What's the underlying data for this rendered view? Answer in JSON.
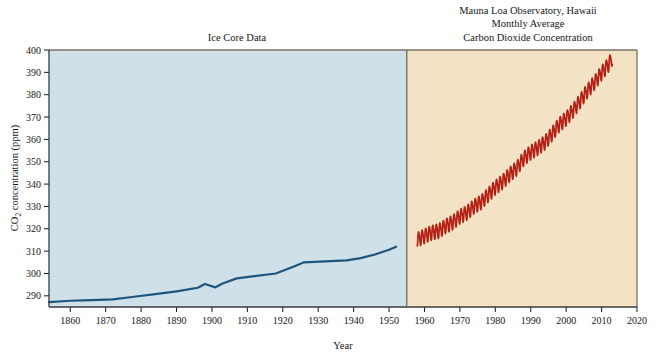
{
  "figure": {
    "titles": {
      "left_panel": "Ice Core Data",
      "right_panel_line1": "Mauna Loa Observatory, Hawaii",
      "right_panel_line2": "Monthly Average",
      "right_panel_line3": "Carbon Dioxide Concentration"
    },
    "colors": {
      "left_panel_background": "#cfe0e9",
      "right_panel_background": "#f4e2c4",
      "ice_core_line": "#1f557c",
      "mauna_loa_line": "#b52015",
      "frame": "#7b7266",
      "text": "#161616",
      "page_background": "#ffffff"
    }
  },
  "chart_data": {
    "type": "line",
    "xlabel": "Year",
    "ylabel": "CO2 concentration (ppm)",
    "ylabel_display": "CO",
    "ylabel_sub": "2",
    "ylabel_rest": " concentration (ppm)",
    "xlim": [
      1854,
      2020
    ],
    "ylim": [
      285,
      400
    ],
    "grid": false,
    "legend": "none",
    "panel_split_year": 1955,
    "xticks": [
      1860,
      1870,
      1880,
      1890,
      1900,
      1910,
      1920,
      1930,
      1940,
      1950,
      1960,
      1970,
      1980,
      1990,
      2000,
      2010,
      2020
    ],
    "yticks": [
      290,
      300,
      310,
      320,
      330,
      340,
      350,
      360,
      370,
      380,
      390,
      400
    ],
    "series": [
      {
        "name": "Ice Core Data",
        "color": "#1f557c",
        "panel": "left",
        "x": [
          1854,
          1860,
          1866,
          1872,
          1878,
          1884,
          1890,
          1896,
          1898,
          1901,
          1903,
          1907,
          1912,
          1918,
          1923,
          1926,
          1932,
          1938,
          1942,
          1946,
          1950,
          1952
        ],
        "values": [
          287.2,
          287.8,
          288.1,
          288.4,
          289.6,
          290.8,
          292.0,
          293.6,
          295.3,
          293.8,
          295.5,
          297.8,
          298.8,
          300.0,
          303.0,
          305.0,
          305.4,
          305.9,
          306.9,
          308.5,
          310.6,
          312.0
        ]
      },
      {
        "name": "Mauna Loa Monthly Average",
        "color": "#b52015",
        "panel": "right",
        "note": "monthly values with seasonal sawtooth oscillation of about 6 ppm peak-to-peak",
        "annual_mean_x": [
          1958,
          1960,
          1962,
          1964,
          1966,
          1968,
          1970,
          1972,
          1974,
          1976,
          1978,
          1980,
          1982,
          1984,
          1986,
          1988,
          1990,
          1992,
          1994,
          1996,
          1998,
          2000,
          2002,
          2004,
          2006,
          2008,
          2010,
          2012,
          2013
        ],
        "annual_mean_values": [
          315.3,
          316.9,
          318.4,
          319.2,
          321.4,
          323.1,
          325.7,
          327.4,
          330.2,
          332.1,
          335.4,
          338.7,
          341.1,
          344.4,
          347.2,
          351.6,
          354.4,
          356.4,
          358.8,
          362.6,
          366.7,
          369.5,
          373.2,
          377.5,
          381.9,
          385.6,
          389.9,
          393.8,
          396.5
        ]
      }
    ]
  }
}
